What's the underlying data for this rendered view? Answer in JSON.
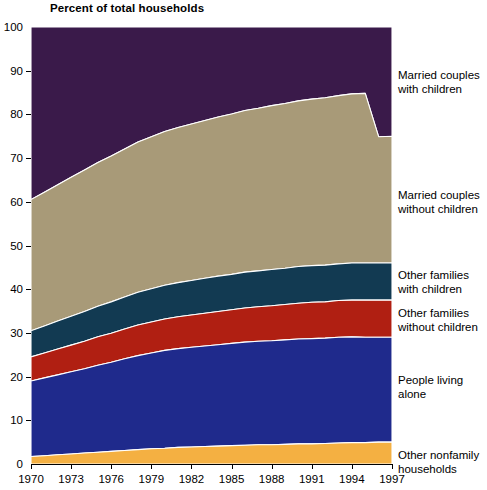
{
  "chart_data": {
    "type": "area",
    "title": "Percent of total households",
    "xlabel": "",
    "ylabel": "Percent of total households",
    "stacked": true,
    "grid": false,
    "legend_position": "right",
    "xlim": [
      1970,
      1997
    ],
    "ylim": [
      0,
      100
    ],
    "x": [
      1970,
      1971,
      1972,
      1973,
      1974,
      1975,
      1976,
      1977,
      1978,
      1979,
      1980,
      1981,
      1982,
      1983,
      1984,
      1985,
      1986,
      1987,
      1988,
      1989,
      1990,
      1991,
      1992,
      1993,
      1994,
      1995,
      1996,
      1997
    ],
    "x_tick_labels": [
      "1970",
      "1973",
      "1976",
      "1979",
      "1982",
      "1985",
      "1988",
      "1991",
      "1994",
      "1997"
    ],
    "y_tick_labels": [
      "0",
      "10",
      "20",
      "30",
      "40",
      "50",
      "60",
      "70",
      "80",
      "90",
      "100"
    ],
    "series": [
      {
        "name": "Other nonfamily households",
        "color": "#f4b042",
        "values": [
          1.7,
          1.9,
          2.1,
          2.3,
          2.5,
          2.7,
          2.9,
          3.1,
          3.3,
          3.5,
          3.6,
          3.8,
          3.9,
          4.0,
          4.1,
          4.2,
          4.3,
          4.4,
          4.4,
          4.5,
          4.6,
          4.6,
          4.7,
          4.8,
          4.9,
          4.9,
          5.0,
          5.0
        ]
      },
      {
        "name": "People living alone",
        "color": "#1f2a8c",
        "values": [
          17.3,
          17.8,
          18.3,
          18.8,
          19.3,
          19.9,
          20.4,
          21.0,
          21.5,
          21.9,
          22.4,
          22.6,
          22.8,
          23.0,
          23.2,
          23.4,
          23.6,
          23.7,
          23.8,
          23.9,
          24.0,
          24.1,
          24.1,
          24.2,
          24.2,
          24.1,
          24.0,
          24.0
        ]
      },
      {
        "name": "Other families without children",
        "color": "#b01f12",
        "values": [
          5.5,
          5.7,
          5.9,
          6.1,
          6.3,
          6.5,
          6.6,
          6.8,
          7.0,
          7.1,
          7.2,
          7.3,
          7.4,
          7.5,
          7.6,
          7.7,
          7.8,
          7.9,
          8.0,
          8.1,
          8.2,
          8.3,
          8.3,
          8.4,
          8.4,
          8.5,
          8.5,
          8.5
        ]
      },
      {
        "name": "Other families with children",
        "color": "#123a52",
        "values": [
          6.0,
          6.2,
          6.4,
          6.6,
          6.8,
          7.0,
          7.2,
          7.3,
          7.5,
          7.6,
          7.7,
          7.8,
          7.9,
          8.0,
          8.1,
          8.1,
          8.2,
          8.2,
          8.3,
          8.3,
          8.4,
          8.4,
          8.4,
          8.4,
          8.5,
          8.5,
          8.5,
          8.5
        ]
      },
      {
        "name": "Married couples without children",
        "color": "#a89a78",
        "values": [
          30.0,
          30.6,
          31.2,
          31.8,
          32.4,
          32.9,
          33.4,
          33.9,
          34.4,
          34.8,
          35.2,
          35.5,
          35.8,
          36.1,
          36.4,
          36.7,
          37.0,
          37.2,
          37.5,
          37.7,
          37.9,
          38.1,
          38.3,
          38.5,
          38.7,
          38.8,
          38.9,
          29.0
        ]
      },
      {
        "name": "Married couples with children",
        "color": "#3a1a4a",
        "values": [
          39.5,
          37.8,
          36.1,
          34.4,
          32.7,
          31.0,
          29.5,
          27.9,
          26.3,
          25.1,
          23.9,
          23.0,
          22.2,
          21.4,
          20.6,
          19.9,
          19.1,
          18.6,
          18.0,
          17.5,
          16.9,
          16.5,
          16.2,
          15.7,
          15.3,
          15.2,
          25.1,
          25.0
        ]
      }
    ],
    "cumulative_boundaries": {
      "note": "Stacked cumulative upper edge of each band, bottom to top",
      "other_nonfamily_households": [
        1.7,
        1.9,
        2.1,
        2.3,
        2.5,
        2.7,
        2.9,
        3.1,
        3.3,
        3.5,
        3.6,
        3.8,
        3.9,
        4.0,
        4.1,
        4.2,
        4.3,
        4.4,
        4.4,
        4.5,
        4.6,
        4.6,
        4.7,
        4.8,
        4.9,
        4.9,
        5.0,
        5.0
      ],
      "people_living_alone": [
        19.0,
        19.7,
        20.4,
        21.1,
        21.8,
        22.6,
        23.3,
        24.1,
        24.8,
        25.4,
        26.0,
        26.4,
        26.7,
        27.0,
        27.3,
        27.6,
        27.9,
        28.1,
        28.2,
        28.4,
        28.6,
        28.7,
        28.8,
        29.0,
        29.1,
        29.0,
        29.0,
        29.0
      ],
      "other_families_without_children": [
        24.5,
        25.4,
        26.3,
        27.2,
        28.1,
        29.1,
        29.9,
        30.9,
        31.8,
        32.5,
        33.2,
        33.7,
        34.1,
        34.5,
        34.9,
        35.3,
        35.7,
        36.0,
        36.2,
        36.5,
        36.8,
        37.0,
        37.1,
        37.4,
        37.5,
        37.5,
        37.5,
        37.5
      ],
      "other_families_with_children": [
        30.5,
        31.6,
        32.7,
        33.8,
        34.9,
        36.1,
        37.1,
        38.2,
        39.3,
        40.1,
        40.9,
        41.5,
        42.0,
        42.5,
        43.0,
        43.4,
        43.9,
        44.2,
        44.5,
        44.8,
        45.2,
        45.4,
        45.5,
        45.8,
        46.0,
        46.0,
        46.0,
        46.0
      ],
      "married_couples_without_children": [
        60.5,
        62.2,
        63.9,
        65.6,
        67.3,
        69.0,
        70.5,
        72.1,
        73.7,
        74.9,
        76.1,
        77.0,
        77.8,
        78.6,
        79.4,
        80.1,
        80.9,
        81.4,
        82.0,
        82.5,
        83.1,
        83.5,
        83.8,
        84.3,
        84.7,
        84.8,
        74.9,
        75.0
      ],
      "married_couples_with_children": [
        100,
        100,
        100,
        100,
        100,
        100,
        100,
        100,
        100,
        100,
        100,
        100,
        100,
        100,
        100,
        100,
        100,
        100,
        100,
        100,
        100,
        100,
        100,
        100,
        100,
        100,
        100,
        100
      ]
    }
  },
  "title": "Percent of total households",
  "y_ticks": [
    {
      "label": "100",
      "value": 100
    },
    {
      "label": "90",
      "value": 90
    },
    {
      "label": "80",
      "value": 80
    },
    {
      "label": "70",
      "value": 70
    },
    {
      "label": "60",
      "value": 60
    },
    {
      "label": "50",
      "value": 50
    },
    {
      "label": "40",
      "value": 40
    },
    {
      "label": "30",
      "value": 30
    },
    {
      "label": "20",
      "value": 20
    },
    {
      "label": "10",
      "value": 10
    },
    {
      "label": "0",
      "value": 0
    }
  ],
  "x_ticks": [
    {
      "label": "1970",
      "value": 1970
    },
    {
      "label": "1973",
      "value": 1973
    },
    {
      "label": "1976",
      "value": 1976
    },
    {
      "label": "1979",
      "value": 1979
    },
    {
      "label": "1982",
      "value": 1982
    },
    {
      "label": "1985",
      "value": 1985
    },
    {
      "label": "1988",
      "value": 1988
    },
    {
      "label": "1991",
      "value": 1991
    },
    {
      "label": "1994",
      "value": 1994
    },
    {
      "label": "1997",
      "value": 1997
    }
  ],
  "legend": [
    {
      "line1": "Married couples",
      "line2": "with children",
      "top": 68,
      "color": "#3a1a4a"
    },
    {
      "line1": "Married couples",
      "line2": "without children",
      "top": 188,
      "color": "#a89a78"
    },
    {
      "line1": "Other families",
      "line2": "with children",
      "top": 268,
      "color": "#123a52"
    },
    {
      "line1": "Other families",
      "line2": "without children",
      "top": 306,
      "color": "#b01f12"
    },
    {
      "line1": "People living",
      "line2": "alone",
      "top": 373,
      "color": "#1f2a8c"
    },
    {
      "line1": "Other nonfamily",
      "line2": "households",
      "top": 448,
      "color": "#f4b042"
    }
  ]
}
